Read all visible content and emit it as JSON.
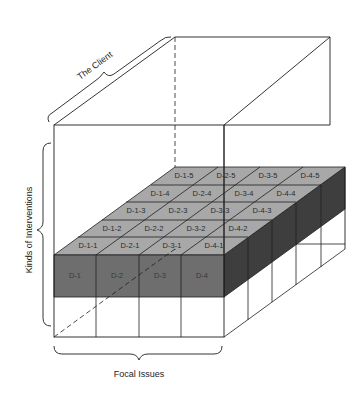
{
  "diagram": {
    "axes": {
      "depth_label": "The Client",
      "vertical_label": "Kinds of Interventions",
      "horizontal_label": "Focal Issues"
    },
    "front_cells": [
      "D-1",
      "D-2",
      "D-3",
      "D-4"
    ],
    "top_grid": [
      [
        "D-1-1",
        "D-2-1",
        "D-3-1",
        "D-4-1"
      ],
      [
        "D-1-2",
        "D-2-2",
        "D-3-2",
        "D-4-2"
      ],
      [
        "D-1-3",
        "D-2-3",
        "D-3-3",
        "D-4-3"
      ],
      [
        "D-1-4",
        "D-2-4",
        "D-3-4",
        "D-4-4"
      ],
      [
        "D-1-5",
        "D-2-5",
        "D-3-5",
        "D-4-5"
      ]
    ],
    "colors": {
      "top_face": "#a8a8a8",
      "front_face": "#6e6e6e",
      "side_face": "#3e3e3e",
      "line": "#1e1e1e"
    }
  }
}
